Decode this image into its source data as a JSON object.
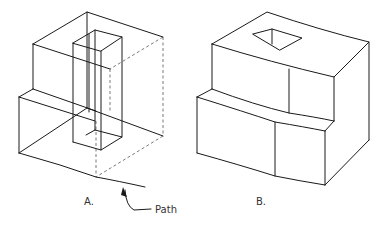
{
  "figure_a": {
    "label": "A.",
    "annotation": "Path"
  },
  "figure_b": {
    "label": "B."
  },
  "colors": {
    "line": "#1a1a1a",
    "hidden_line": "#555555",
    "text": "#333333",
    "background": "#ffffff"
  }
}
